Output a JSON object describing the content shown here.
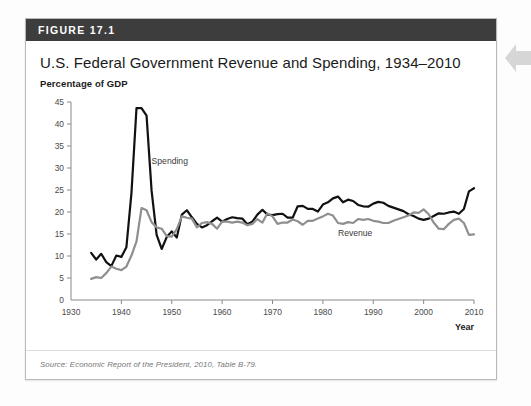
{
  "figure": {
    "header_label": "FIGURE 17.1",
    "title": "U.S. Federal Government Revenue and Spending, 1934–2010",
    "source": "Source: Economic Report of the President, 2010, Table B-79.",
    "header_bg": "#3d3d3d",
    "border_color": "#b9b9b9"
  },
  "side_arrow": {
    "name": "left-pointing-tab-arrow",
    "color": "#d6d6d6"
  },
  "chart_data": {
    "type": "line",
    "title": "U.S. Federal Government Revenue and Spending, 1934–2010",
    "subtitle": "Percentage of GDP",
    "xlabel": "Year",
    "ylabel": "Percentage of GDP",
    "xlim": [
      1930,
      2010
    ],
    "ylim": [
      0,
      45
    ],
    "xticks": [
      1930,
      1940,
      1950,
      1960,
      1970,
      1980,
      1990,
      2000,
      2010
    ],
    "yticks": [
      0,
      5,
      10,
      15,
      20,
      25,
      30,
      35,
      40,
      45
    ],
    "grid": false,
    "legend": "inline-annotations",
    "annotations": [
      {
        "text": "Spending",
        "x": 1946,
        "y": 31
      },
      {
        "text": "Revenue",
        "x": 1983,
        "y": 14.5
      }
    ],
    "x": [
      1934,
      1935,
      1936,
      1937,
      1938,
      1939,
      1940,
      1941,
      1942,
      1943,
      1944,
      1945,
      1946,
      1947,
      1948,
      1949,
      1950,
      1951,
      1952,
      1953,
      1954,
      1955,
      1956,
      1957,
      1958,
      1959,
      1960,
      1961,
      1962,
      1963,
      1964,
      1965,
      1966,
      1967,
      1968,
      1969,
      1970,
      1971,
      1972,
      1973,
      1974,
      1975,
      1976,
      1977,
      1978,
      1979,
      1980,
      1981,
      1982,
      1983,
      1984,
      1985,
      1986,
      1987,
      1988,
      1989,
      1990,
      1991,
      1992,
      1993,
      1994,
      1995,
      1996,
      1997,
      1998,
      1999,
      2000,
      2001,
      2002,
      2003,
      2004,
      2005,
      2006,
      2007,
      2008,
      2009,
      2010
    ],
    "series": [
      {
        "name": "Spending",
        "color": "#111111",
        "linewidth": 2.2,
        "values": [
          10.7,
          9.2,
          10.5,
          8.6,
          7.7,
          10.1,
          9.8,
          12.0,
          24.3,
          43.6,
          43.6,
          41.9,
          24.8,
          14.8,
          11.6,
          14.3,
          15.6,
          14.2,
          19.4,
          20.4,
          18.8,
          17.3,
          16.5,
          17.0,
          17.9,
          18.7,
          17.8,
          18.4,
          18.8,
          18.6,
          18.5,
          17.2,
          17.8,
          19.4,
          20.5,
          19.4,
          19.3,
          19.5,
          19.6,
          18.7,
          18.7,
          21.3,
          21.4,
          20.7,
          20.7,
          20.1,
          21.7,
          22.2,
          23.1,
          23.5,
          22.2,
          22.8,
          22.5,
          21.6,
          21.3,
          21.2,
          21.9,
          22.3,
          22.1,
          21.4,
          21.0,
          20.6,
          20.2,
          19.5,
          19.1,
          18.5,
          18.2,
          18.5,
          19.1,
          19.7,
          19.6,
          19.9,
          20.1,
          19.6,
          20.7,
          24.7,
          25.4
        ]
      },
      {
        "name": "Revenue",
        "color": "#8f8f8f",
        "linewidth": 2.2,
        "values": [
          4.8,
          5.2,
          5.0,
          6.1,
          7.6,
          7.1,
          6.8,
          7.6,
          10.1,
          13.3,
          20.9,
          20.4,
          17.7,
          16.5,
          16.2,
          14.5,
          14.4,
          16.1,
          19.0,
          18.7,
          18.5,
          16.5,
          17.5,
          17.7,
          17.3,
          16.2,
          17.8,
          17.8,
          17.6,
          17.8,
          17.6,
          17.0,
          17.3,
          18.4,
          17.6,
          19.7,
          19.0,
          17.3,
          17.6,
          17.6,
          18.3,
          17.9,
          17.1,
          18.0,
          18.0,
          18.5,
          19.0,
          19.6,
          19.2,
          17.5,
          17.3,
          17.7,
          17.5,
          18.4,
          18.2,
          18.4,
          18.0,
          17.8,
          17.5,
          17.5,
          18.0,
          18.4,
          18.8,
          19.2,
          19.9,
          19.8,
          20.6,
          19.5,
          17.6,
          16.2,
          16.1,
          17.3,
          18.2,
          18.5,
          17.5,
          14.8,
          14.9
        ]
      }
    ]
  }
}
